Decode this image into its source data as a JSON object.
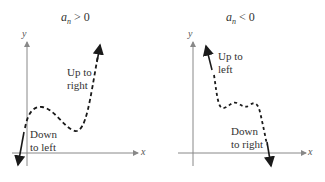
{
  "panels": [
    {
      "title": {
        "var": "a",
        "sub": "n",
        "op": "> 0"
      },
      "x_label": "x",
      "y_label": "y",
      "annotations": [
        {
          "line1": "Up to",
          "line2": "right"
        },
        {
          "line1": "Down",
          "line2": "to left"
        }
      ]
    },
    {
      "title": {
        "var": "a",
        "sub": "n",
        "op": "< 0"
      },
      "x_label": "x",
      "y_label": "y",
      "annotations": [
        {
          "line1": "Up to",
          "line2": "left"
        },
        {
          "line1": "Down",
          "line2": "to right"
        }
      ]
    }
  ],
  "colors": {
    "axis": "#888888",
    "curve": "#1a1a1a",
    "text": "#333333"
  }
}
